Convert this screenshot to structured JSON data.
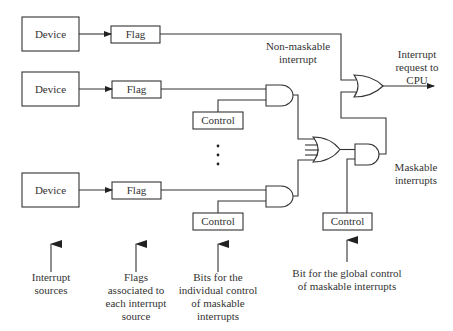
{
  "diagram": {
    "type": "interrupt-logic",
    "devices": [
      {
        "label": "Device"
      },
      {
        "label": "Device"
      },
      {
        "label": "Device"
      }
    ],
    "flags": [
      {
        "label": "Flag"
      },
      {
        "label": "Flag"
      },
      {
        "label": "Flag"
      }
    ],
    "controls": {
      "individual_top": "Control",
      "individual_bottom": "Control",
      "global": "Control"
    },
    "labels": {
      "non_maskable": [
        "Non-maskable",
        "interrupt"
      ],
      "interrupt_request": [
        "Interrupt",
        "request to",
        "CPU"
      ],
      "maskable": [
        "Maskable",
        "interrupts"
      ]
    },
    "annotations": {
      "interrupt_sources": [
        "Interrupt",
        "sources"
      ],
      "flags_associated": [
        "Flags",
        "associated to",
        "each interrupt",
        "source"
      ],
      "bits_individual": [
        "Bits for the",
        "individual control",
        "of maskable",
        "interrupts"
      ],
      "bit_global": [
        "Bit for the global control",
        "of maskable interrupts"
      ]
    },
    "ellipsis": "⋮"
  }
}
